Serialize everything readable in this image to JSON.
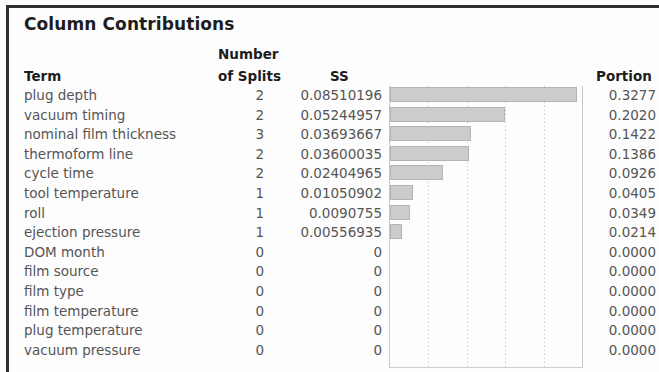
{
  "panel": {
    "title": "Column Contributions"
  },
  "table": {
    "headers": {
      "term": "Term",
      "splits_line1": "Number",
      "splits_line2": "of Splits",
      "ss": "SS",
      "portion": "Portion"
    },
    "rows": [
      {
        "term": "plug depth",
        "splits": "2",
        "ss": "0.08510196",
        "portion": "0.3277"
      },
      {
        "term": "vacuum timing",
        "splits": "2",
        "ss": "0.05244957",
        "portion": "0.2020"
      },
      {
        "term": "nominal film thickness",
        "splits": "3",
        "ss": "0.03693667",
        "portion": "0.1422"
      },
      {
        "term": "thermoform line",
        "splits": "2",
        "ss": "0.03600035",
        "portion": "0.1386"
      },
      {
        "term": "cycle time",
        "splits": "2",
        "ss": "0.02404965",
        "portion": "0.0926"
      },
      {
        "term": "tool temperature",
        "splits": "1",
        "ss": "0.01050902",
        "portion": "0.0405"
      },
      {
        "term": "roll",
        "splits": "1",
        "ss": "0.0090755",
        "portion": "0.0349"
      },
      {
        "term": "ejection pressure",
        "splits": "1",
        "ss": "0.00556935",
        "portion": "0.0214"
      },
      {
        "term": "DOM month",
        "splits": "0",
        "ss": "0",
        "portion": "0.0000"
      },
      {
        "term": "film source",
        "splits": "0",
        "ss": "0",
        "portion": "0.0000"
      },
      {
        "term": "film type",
        "splits": "0",
        "ss": "0",
        "portion": "0.0000"
      },
      {
        "term": "film temperature",
        "splits": "0",
        "ss": "0",
        "portion": "0.0000"
      },
      {
        "term": "plug temperature",
        "splits": "0",
        "ss": "0",
        "portion": "0.0000"
      },
      {
        "term": "vacuum pressure",
        "splits": "0",
        "ss": "0",
        "portion": "0.0000"
      }
    ]
  },
  "chart_data": {
    "type": "bar",
    "orientation": "horizontal",
    "title": "Column Contributions",
    "xlabel": "",
    "ylabel": "Term",
    "grid": true,
    "legend": null,
    "categories": [
      "plug depth",
      "vacuum timing",
      "nominal film thickness",
      "thermoform line",
      "cycle time",
      "tool temperature",
      "roll",
      "ejection pressure",
      "DOM month",
      "film source",
      "film type",
      "film temperature",
      "plug temperature",
      "vacuum pressure"
    ],
    "series": [
      {
        "name": "SS",
        "values": [
          0.08510196,
          0.05244957,
          0.03693667,
          0.03600035,
          0.02404965,
          0.01050902,
          0.0090755,
          0.00556935,
          0,
          0,
          0,
          0,
          0,
          0
        ]
      },
      {
        "name": "Portion",
        "values": [
          0.3277,
          0.202,
          0.1422,
          0.1386,
          0.0926,
          0.0405,
          0.0349,
          0.0214,
          0.0,
          0.0,
          0.0,
          0.0,
          0.0,
          0.0
        ]
      },
      {
        "name": "Number of Splits",
        "values": [
          2,
          2,
          3,
          2,
          2,
          1,
          1,
          1,
          0,
          0,
          0,
          0,
          0,
          0
        ]
      }
    ],
    "bar_series": "SS",
    "xlim": [
      0,
      0.0875
    ],
    "gridline_fractions": [
      0.2,
      0.4,
      0.6,
      0.8
    ],
    "colors": {
      "bar_fill": "#cccccc",
      "bar_stroke": "#b4b4b4",
      "gridline": "#bfbfbf",
      "text": "#555555",
      "header_text": "#1d1d1d",
      "frame": "#2f2f2f"
    }
  }
}
